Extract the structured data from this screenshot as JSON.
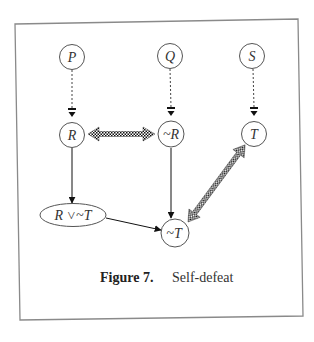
{
  "figure": {
    "caption": {
      "number": "Figure 7.",
      "title": "Self-defeat"
    },
    "colors": {
      "frame": "#8a8a8a",
      "stroke": "#555555",
      "ink": "#222222",
      "background": "#ffffff"
    },
    "nodes": [
      {
        "id": "P",
        "label": "P",
        "shape": "circle",
        "cx": 72,
        "cy": 57
      },
      {
        "id": "Q",
        "label": "Q",
        "shape": "circle",
        "cx": 170,
        "cy": 56
      },
      {
        "id": "S",
        "label": "S",
        "shape": "circle",
        "cx": 252,
        "cy": 56
      },
      {
        "id": "R",
        "label": "R",
        "shape": "circle",
        "cx": 72,
        "cy": 135
      },
      {
        "id": "notR",
        "label": "~R",
        "shape": "circle",
        "cx": 171,
        "cy": 134
      },
      {
        "id": "T",
        "label": "T",
        "shape": "circle",
        "cx": 254,
        "cy": 134
      },
      {
        "id": "RorNotT",
        "label": "R ˅~T",
        "shape": "ellipse",
        "cx": 73,
        "cy": 215
      },
      {
        "id": "notT",
        "label": "~T",
        "shape": "circle",
        "cx": 175,
        "cy": 233
      }
    ],
    "edges": [
      {
        "from": "P",
        "to": "R",
        "type": "dashed-defeasible"
      },
      {
        "from": "Q",
        "to": "notR",
        "type": "dashed-defeasible"
      },
      {
        "from": "S",
        "to": "T",
        "type": "dashed-defeasible"
      },
      {
        "from": "R",
        "to": "notR",
        "type": "checkered-bidirectional-defeat"
      },
      {
        "from": "T",
        "to": "notT",
        "type": "checkered-bidirectional-defeat"
      },
      {
        "from": "R",
        "to": "RorNotT",
        "type": "solid-conclusive"
      },
      {
        "from": "notR",
        "to": "notT",
        "type": "solid-conclusive"
      },
      {
        "from": "RorNotT",
        "to": "notT",
        "type": "solid-conclusive"
      }
    ]
  }
}
